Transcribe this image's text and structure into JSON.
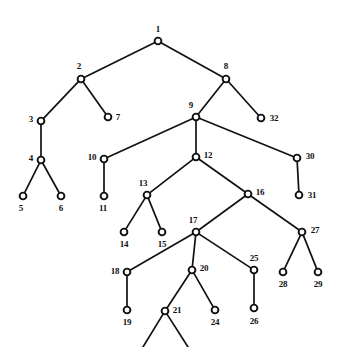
{
  "figure": {
    "type": "tree-diagram",
    "title": "",
    "background_color": "#ffffff",
    "node_stroke_color": "#111111",
    "node_fill_color": "#ffffff",
    "edge_color": "#111111",
    "label_color": "#111111",
    "canvas": {
      "width": 341,
      "height": 347
    }
  },
  "nodes": [
    {
      "id": "1",
      "label": "1",
      "x": 158,
      "y": 41,
      "label_x": 158,
      "label_y": 29
    },
    {
      "id": "2",
      "label": "2",
      "x": 81,
      "y": 79,
      "label_x": 79,
      "label_y": 66
    },
    {
      "id": "3",
      "label": "3",
      "x": 41,
      "y": 121,
      "label_x": 31,
      "label_y": 119
    },
    {
      "id": "4",
      "label": "4",
      "x": 41,
      "y": 160,
      "label_x": 31,
      "label_y": 158
    },
    {
      "id": "5",
      "label": "5",
      "x": 23,
      "y": 196,
      "label_x": 21,
      "label_y": 208
    },
    {
      "id": "6",
      "label": "6",
      "x": 61,
      "y": 196,
      "label_x": 61,
      "label_y": 208
    },
    {
      "id": "7",
      "label": "7",
      "x": 108,
      "y": 117,
      "label_x": 118,
      "label_y": 117
    },
    {
      "id": "8",
      "label": "8",
      "x": 226,
      "y": 79,
      "label_x": 226,
      "label_y": 66
    },
    {
      "id": "9",
      "label": "9",
      "x": 196,
      "y": 117,
      "label_x": 191,
      "label_y": 105
    },
    {
      "id": "10",
      "label": "10",
      "x": 104,
      "y": 159,
      "label_x": 92,
      "label_y": 157
    },
    {
      "id": "11",
      "label": "11",
      "x": 104,
      "y": 196,
      "label_x": 103,
      "label_y": 208
    },
    {
      "id": "12",
      "label": "12",
      "x": 196,
      "y": 157,
      "label_x": 208,
      "label_y": 155
    },
    {
      "id": "13",
      "label": "13",
      "x": 147,
      "y": 195,
      "label_x": 143,
      "label_y": 183
    },
    {
      "id": "14",
      "label": "14",
      "x": 124,
      "y": 232,
      "label_x": 124,
      "label_y": 244
    },
    {
      "id": "15",
      "label": "15",
      "x": 162,
      "y": 232,
      "label_x": 162,
      "label_y": 244
    },
    {
      "id": "16",
      "label": "16",
      "x": 248,
      "y": 194,
      "label_x": 260,
      "label_y": 192
    },
    {
      "id": "17",
      "label": "17",
      "x": 196,
      "y": 232,
      "label_x": 193,
      "label_y": 220
    },
    {
      "id": "18",
      "label": "18",
      "x": 127,
      "y": 272,
      "label_x": 115,
      "label_y": 271
    },
    {
      "id": "19",
      "label": "19",
      "x": 127,
      "y": 310,
      "label_x": 127,
      "label_y": 322
    },
    {
      "id": "20",
      "label": "20",
      "x": 192,
      "y": 270,
      "label_x": 204,
      "label_y": 268
    },
    {
      "id": "21",
      "label": "21",
      "x": 165,
      "y": 311,
      "label_x": 177,
      "label_y": 310
    },
    {
      "id": "24",
      "label": "24",
      "x": 215,
      "y": 310,
      "label_x": 215,
      "label_y": 322
    },
    {
      "id": "25",
      "label": "25",
      "x": 254,
      "y": 270,
      "label_x": 254,
      "label_y": 258
    },
    {
      "id": "26",
      "label": "26",
      "x": 254,
      "y": 308,
      "label_x": 254,
      "label_y": 321
    },
    {
      "id": "27",
      "label": "27",
      "x": 302,
      "y": 232,
      "label_x": 315,
      "label_y": 230
    },
    {
      "id": "28",
      "label": "28",
      "x": 283,
      "y": 272,
      "label_x": 283,
      "label_y": 284
    },
    {
      "id": "29",
      "label": "29",
      "x": 318,
      "y": 272,
      "label_x": 318,
      "label_y": 284
    },
    {
      "id": "30",
      "label": "30",
      "x": 297,
      "y": 158,
      "label_x": 310,
      "label_y": 156
    },
    {
      "id": "31",
      "label": "31",
      "x": 299,
      "y": 195,
      "label_x": 312,
      "label_y": 195
    },
    {
      "id": "32",
      "label": "32",
      "x": 261,
      "y": 118,
      "label_x": 274,
      "label_y": 118
    }
  ],
  "edges": [
    {
      "from": "1",
      "to": "2"
    },
    {
      "from": "1",
      "to": "8"
    },
    {
      "from": "2",
      "to": "3"
    },
    {
      "from": "2",
      "to": "7"
    },
    {
      "from": "3",
      "to": "4"
    },
    {
      "from": "4",
      "to": "5"
    },
    {
      "from": "4",
      "to": "6"
    },
    {
      "from": "8",
      "to": "9"
    },
    {
      "from": "8",
      "to": "32"
    },
    {
      "from": "9",
      "to": "10"
    },
    {
      "from": "9",
      "to": "12"
    },
    {
      "from": "9",
      "to": "30"
    },
    {
      "from": "10",
      "to": "11"
    },
    {
      "from": "12",
      "to": "13"
    },
    {
      "from": "12",
      "to": "16"
    },
    {
      "from": "13",
      "to": "14"
    },
    {
      "from": "13",
      "to": "15"
    },
    {
      "from": "16",
      "to": "17"
    },
    {
      "from": "16",
      "to": "27"
    },
    {
      "from": "17",
      "to": "18"
    },
    {
      "from": "17",
      "to": "20"
    },
    {
      "from": "17",
      "to": "25"
    },
    {
      "from": "18",
      "to": "19"
    },
    {
      "from": "20",
      "to": "21"
    },
    {
      "from": "20",
      "to": "24"
    },
    {
      "from": "25",
      "to": "26"
    },
    {
      "from": "27",
      "to": "28"
    },
    {
      "from": "27",
      "to": "29"
    },
    {
      "from": "30",
      "to": "31"
    }
  ],
  "clipped_edges": [
    {
      "from": "21",
      "to_x": 143,
      "to_y": 347
    },
    {
      "from": "21",
      "to_x": 188,
      "to_y": 347
    }
  ],
  "node_radius": 3.4
}
